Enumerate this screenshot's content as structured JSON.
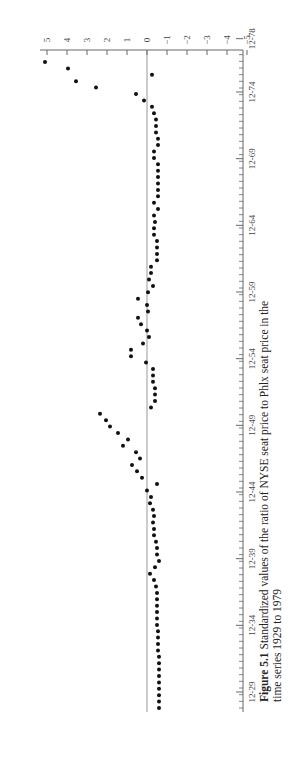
{
  "caption": {
    "label": "Figure 5.1",
    "text": "Standardized values of the ratio of NYSE seat price to Phlx seat price in the",
    "text2": "time series 1929 to 1979"
  },
  "chart_data": {
    "type": "scatter",
    "title": "Standardized values of the ratio of NYSE seat price to Phlx seat price in the time series 1929 to 1979",
    "xlabel": "Time (month-year)",
    "ylabel": "Standardized value",
    "orientation": "rotated 90° counter-clockwise (time runs bottom to top, values increase to the left)",
    "x_tick_labels": [
      "12-29",
      "12-34",
      "12-39",
      "12-44",
      "12-49",
      "12-54",
      "12-59",
      "12-64",
      "12-69",
      "12-74",
      "12-78"
    ],
    "y_tick_labels": [
      "5",
      "4",
      "3",
      "2",
      "1",
      "0",
      "−1",
      "−2",
      "−3",
      "−4",
      "−5"
    ],
    "ylim": [
      -5,
      5
    ],
    "grid": false,
    "zero_line": true,
    "frequency": "semi-annual",
    "values": [
      -0.55,
      -0.55,
      -0.55,
      -0.55,
      -0.55,
      -0.55,
      -0.55,
      -0.55,
      -0.55,
      -0.5,
      -0.5,
      -0.5,
      -0.5,
      -0.45,
      -0.45,
      -0.45,
      -0.45,
      -0.45,
      -0.45,
      -0.4,
      -0.3,
      -0.1,
      -0.35,
      -0.55,
      -0.45,
      -0.45,
      -0.4,
      -0.3,
      -0.3,
      -0.25,
      -0.3,
      -0.25,
      -0.1,
      -0.15,
      0.05,
      -0.45,
      0.3,
      0.55,
      0.8,
      0.4,
      0.6,
      1.25,
      1.0,
      1.5,
      1.9,
      2.1,
      2.4,
      -0.15,
      -0.35,
      -0.35,
      -0.35,
      -0.25,
      -0.25,
      -0.25,
      0.1,
      0.85,
      0.85,
      0.25,
      -0.05,
      0.05,
      0.35,
      0.5,
      0.0,
      0.05,
      0.5,
      0.0,
      -0.25,
      -0.05,
      -0.15,
      -0.15,
      -0.45,
      -0.45,
      -0.45,
      -0.45,
      -0.3,
      -0.3,
      -0.35,
      -0.3,
      -0.5,
      -0.3,
      -0.5,
      -0.5,
      -0.5,
      -0.5,
      -0.5,
      -0.5,
      -0.3,
      -0.3,
      -0.5,
      -0.5,
      -0.4,
      -0.4,
      -0.4,
      -0.3,
      -0.2,
      0.2,
      0.6,
      2.6,
      3.6,
      -0.2,
      4.0,
      5.15
    ]
  }
}
